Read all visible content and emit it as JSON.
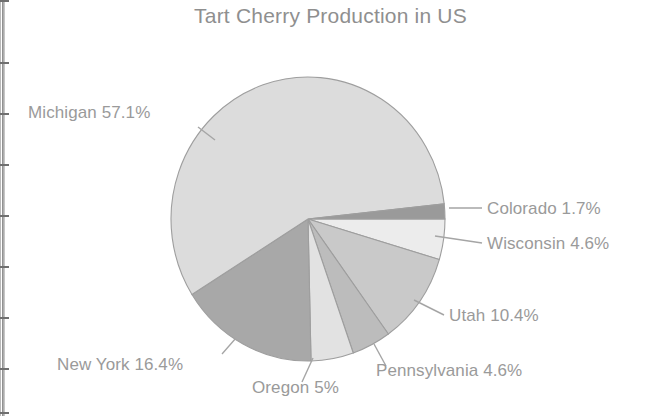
{
  "chart_data": {
    "type": "pie",
    "title": "Tart Cherry Production in US",
    "xlabel": "",
    "ylabel": "",
    "legend_position": "callout-labels",
    "grid": false,
    "categories": [
      "Michigan",
      "New York",
      "Oregon",
      "Pennsylvania",
      "Utah",
      "Wisconsin",
      "Colorado"
    ],
    "values": [
      57.1,
      16.4,
      5,
      4.6,
      10.4,
      4.6,
      1.7
    ],
    "unit": "%",
    "slices": [
      {
        "label": "Michigan 57.1%",
        "name": "Michigan",
        "value": 57.1,
        "value_text": "57.1%",
        "color": "#dcdcdc"
      },
      {
        "label": "New York 16.4%",
        "name": "New York",
        "value": 16.4,
        "value_text": "16.4%",
        "color": "#a8a8a8"
      },
      {
        "label": "Oregon 5%",
        "name": "Oregon",
        "value": 5,
        "value_text": "5%",
        "color": "#e2e2e2"
      },
      {
        "label": "Pennsylvania 4.6%",
        "name": "Pennsylvania",
        "value": 4.6,
        "value_text": "4.6%",
        "color": "#bcbcbc"
      },
      {
        "label": "Utah 10.4%",
        "name": "Utah",
        "value": 10.4,
        "value_text": "10.4%",
        "color": "#c9c9c9"
      },
      {
        "label": "Wisconsin 4.6%",
        "name": "Wisconsin",
        "value": 4.6,
        "value_text": "4.6%",
        "color": "#ececec"
      },
      {
        "label": "Colorado 1.7%",
        "name": "Colorado",
        "value": 1.7,
        "value_text": "1.7%",
        "color": "#9a9a9a"
      }
    ]
  },
  "labels": {
    "michigan": "Michigan 57.1%",
    "new_york": "New York 16.4%",
    "oregon": "Oregon 5%",
    "pennsylvania": "Pennsylvania 4.6%",
    "utah": "Utah 10.4%",
    "wisconsin": "Wisconsin 4.6%",
    "colorado": "Colorado 1.7%"
  },
  "colors": {
    "text": "#9a9a9a",
    "title": "#8f8f8f",
    "outline": "#9e9e9e",
    "background": "#ffffff"
  }
}
